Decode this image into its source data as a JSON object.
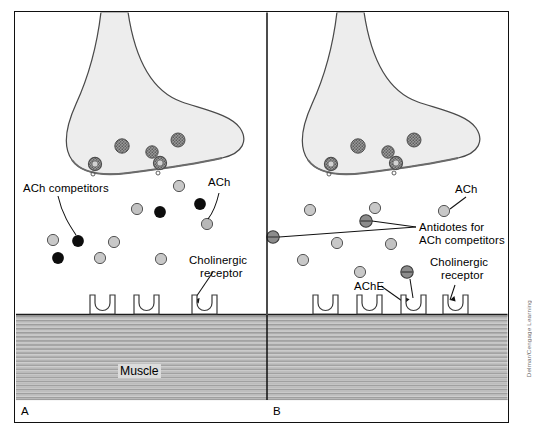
{
  "figure": {
    "credit": "Delmar/Cengage Learning",
    "muscle_label": "Muscle"
  },
  "panels": [
    {
      "id": "A",
      "letter": "A",
      "labels": {
        "ach_competitors": "ACh competitors",
        "ach": "ACh",
        "cholinergic_receptor_line1": "Cholinergic",
        "cholinergic_receptor_line2": "receptor"
      }
    },
    {
      "id": "B",
      "letter": "B",
      "labels": {
        "ach": "ACh",
        "antidotes_line1": "Antidotes for",
        "antidotes_line2": "ACh competitors",
        "ache": "AChE",
        "cholinergic_receptor_line1": "Cholinergic",
        "cholinergic_receptor_line2": "receptor"
      }
    }
  ],
  "colors": {
    "ach_dot": "#c8c8c8",
    "competitor_dot": "#0d0d0d",
    "antidote_dot": "#8c8c8c",
    "terminal_fill": "#ededed",
    "muscle_fill": "#c9c9c9",
    "outline": "#3a3a3a",
    "frame": "#111111"
  },
  "legend_meaning": {
    "light_gray_circle": "ACh (acetylcholine) molecule",
    "black_circle": "ACh competitor molecule",
    "dark_gray_circle_with_bar": "Antidote for ACh competitors",
    "stippled_circle": "synaptic vesicle",
    "u_shaped_notch": "cholinergic receptor"
  }
}
